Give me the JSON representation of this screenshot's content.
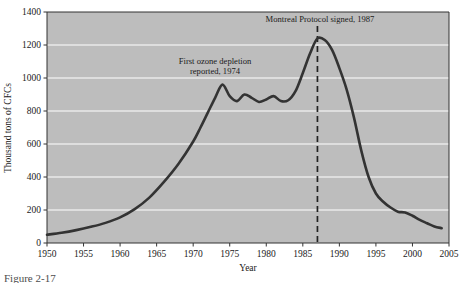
{
  "figure": {
    "caption": "Figure 2-17",
    "background_color": "#ffffff",
    "plot_background_color": "#bdbdbd",
    "grid_color": "#ffffff",
    "series_color": "#333333",
    "axis_color": "#333333"
  },
  "chart_data": {
    "type": "line",
    "title": "",
    "xlabel": "Year",
    "ylabel": "Thousand tons of CFCs",
    "xlim": [
      1950,
      2005
    ],
    "ylim": [
      0,
      1400
    ],
    "xticks": [
      "1950",
      "1955",
      "1960",
      "1965",
      "1970",
      "1975",
      "1980",
      "1985",
      "1990",
      "1995",
      "2000",
      "2005"
    ],
    "yticks": [
      "0",
      "200",
      "400",
      "600",
      "800",
      "1000",
      "1200",
      "1400"
    ],
    "grid": "horizontal",
    "legend": "none",
    "series": [
      {
        "name": "CFC production",
        "x": [
          1950,
          1952,
          1954,
          1956,
          1958,
          1960,
          1962,
          1964,
          1966,
          1968,
          1970,
          1971,
          1972,
          1973,
          1974,
          1975,
          1976,
          1977,
          1978,
          1979,
          1980,
          1981,
          1982,
          1983,
          1984,
          1985,
          1986,
          1987,
          1988,
          1989,
          1990,
          1991,
          1992,
          1993,
          1994,
          1995,
          1996,
          1997,
          1998,
          1999,
          2000,
          2001,
          2002,
          2003,
          2004
        ],
        "values": [
          50,
          62,
          78,
          98,
          122,
          155,
          205,
          275,
          370,
          480,
          615,
          700,
          790,
          880,
          960,
          890,
          860,
          900,
          880,
          855,
          870,
          890,
          860,
          865,
          920,
          1030,
          1150,
          1240,
          1230,
          1170,
          1060,
          930,
          760,
          560,
          400,
          300,
          250,
          215,
          190,
          185,
          165,
          140,
          120,
          100,
          90
        ]
      }
    ],
    "annotations": [
      {
        "name": "first-ozone-depletion",
        "text_line1": "First ozone depletion",
        "text_line2": "reported, 1974",
        "x": 1974,
        "y": 1085
      },
      {
        "name": "montreal-protocol",
        "text": "Montreal Protocol signed, 1987",
        "x": 1987,
        "y": 1385,
        "marker": "vertical-dashed-line"
      }
    ],
    "reference_lines": [
      {
        "name": "montreal-protocol-line",
        "orientation": "vertical",
        "x": 1987,
        "style": "dashed"
      }
    ]
  }
}
